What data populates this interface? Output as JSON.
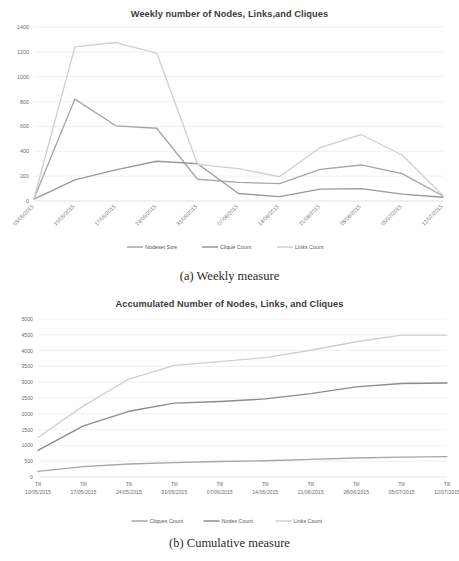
{
  "figures": [
    {
      "caption": "(a) Weekly measure",
      "chart_data": {
        "type": "line",
        "title": "Weekly number of Nodes, Links,and  Cliques",
        "xlabel": "",
        "ylabel": "",
        "ylim": [
          0,
          1400
        ],
        "yticks": [
          0,
          200,
          400,
          600,
          800,
          1000,
          1200,
          1400
        ],
        "grid": true,
        "legend_position": "bottom",
        "tick_rotation": -45,
        "categories": [
          "03/05/2015",
          "10/05/2015",
          "17/05/2015",
          "24/05/2015",
          "31/05/2015",
          "07/06/2015",
          "14/06/2015",
          "21/06/2015",
          "28/06/2015",
          "05/07/2015",
          "12/07/2015"
        ],
        "series": [
          {
            "name": "Nodeset Size",
            "color": "#a6a6a6",
            "values": [
              20,
              820,
              605,
              585,
              175,
              150,
              140,
              255,
              290,
              220,
              40
            ]
          },
          {
            "name": "Clique Count",
            "color": "#999999",
            "values": [
              15,
              170,
              250,
              320,
              300,
              60,
              35,
              95,
              100,
              55,
              30
            ]
          },
          {
            "name": "Links Count",
            "color": "#d0d0d0",
            "values": [
              20,
              1240,
              1275,
              1190,
              295,
              260,
              195,
              430,
              535,
              370,
              45
            ]
          }
        ]
      }
    },
    {
      "caption": "(b) Cumulative measure",
      "chart_data": {
        "type": "line",
        "title": "Accumulated Number of Nodes, Links, and Cliques",
        "xlabel": "",
        "ylabel": "",
        "ylim": [
          0,
          5000
        ],
        "yticks": [
          0,
          500,
          1000,
          1500,
          2000,
          2500,
          3000,
          3500,
          4000,
          4500,
          5000
        ],
        "grid": true,
        "legend_position": "bottom",
        "tick_rotation": 0,
        "tick_prefix": "Till",
        "categories": [
          "10/05/2015",
          "17/05/2015",
          "24/05/2015",
          "31/05/2015",
          "07/06/2015",
          "14/06/2015",
          "21/06/2015",
          "28/06/2015",
          "05/07/2015",
          "12/07/2015"
        ],
        "series": [
          {
            "name": "Cliques Count",
            "color": "#a6a6a6",
            "values": [
              180,
              330,
              410,
              455,
              490,
              515,
              560,
              600,
              630,
              645
            ]
          },
          {
            "name": "Nodes Count",
            "color": "#8c8c8c",
            "values": [
              840,
              1620,
              2080,
              2340,
              2390,
              2470,
              2640,
              2850,
              2960,
              2975
            ]
          },
          {
            "name": "Links Count",
            "color": "#cfcfcf",
            "values": [
              1250,
              2250,
              3100,
              3530,
              3650,
              3780,
              4010,
              4280,
              4490,
              4490
            ]
          }
        ]
      }
    }
  ]
}
